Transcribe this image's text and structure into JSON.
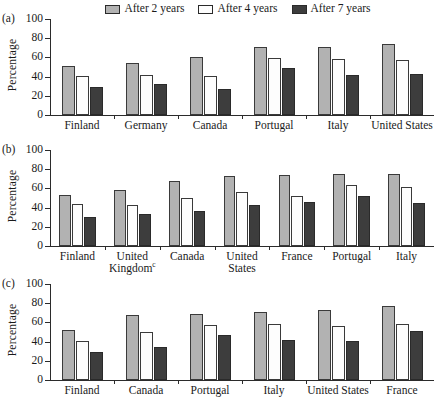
{
  "legend": {
    "entries": [
      {
        "label": "After 2 years",
        "color": "#b2b2b2",
        "name": "after-2-years"
      },
      {
        "label": "After 4 years",
        "color": "#fdfdfd",
        "name": "after-4-years"
      },
      {
        "label": "After 7 years",
        "color": "#3d3d3d",
        "name": "after-7-years"
      }
    ]
  },
  "axis": {
    "ylabel": "Percentage",
    "yticks": [
      0,
      20,
      40,
      60,
      80,
      100
    ],
    "ylim": [
      0,
      100
    ]
  },
  "panels": [
    {
      "tag": "(a)"
    },
    {
      "tag": "(b)"
    },
    {
      "tag": "(c)"
    }
  ],
  "chart_data": [
    {
      "type": "bar",
      "panel": "(a)",
      "title": "",
      "xlabel": "",
      "ylabel": "Percentage",
      "ylim": [
        0,
        100
      ],
      "yticks": [
        0,
        20,
        40,
        60,
        80,
        100
      ],
      "grid": false,
      "legend_position": "top-center",
      "categories": [
        "Finland",
        "Germany",
        "Canada",
        "Portugal",
        "Italy",
        "United States"
      ],
      "series": [
        {
          "name": "After 2 years",
          "color": "#b2b2b2",
          "values": [
            51,
            54,
            60,
            71,
            71,
            74
          ]
        },
        {
          "name": "After 4 years",
          "color": "#fdfdfd",
          "values": [
            41,
            42,
            41,
            59,
            58,
            57
          ]
        },
        {
          "name": "After 7 years",
          "color": "#3d3d3d",
          "values": [
            29,
            32,
            27,
            49,
            42,
            43
          ]
        }
      ]
    },
    {
      "type": "bar",
      "panel": "(b)",
      "title": "",
      "xlabel": "",
      "ylabel": "Percentage",
      "ylim": [
        0,
        100
      ],
      "yticks": [
        0,
        20,
        40,
        60,
        80,
        100
      ],
      "grid": false,
      "legend_position": "top-center",
      "categories": [
        "Finland",
        "United Kingdomᶜ",
        "Canada",
        "United States",
        "France",
        "Portugal",
        "Italy"
      ],
      "series": [
        {
          "name": "After 2 years",
          "color": "#b2b2b2",
          "values": [
            53,
            58,
            68,
            73,
            74,
            75,
            75
          ]
        },
        {
          "name": "After 4 years",
          "color": "#fdfdfd",
          "values": [
            44,
            43,
            50,
            56,
            52,
            64,
            61
          ]
        },
        {
          "name": "After 7 years",
          "color": "#3d3d3d",
          "values": [
            30,
            33,
            36,
            43,
            46,
            52,
            45
          ]
        }
      ]
    },
    {
      "type": "bar",
      "panel": "(c)",
      "title": "",
      "xlabel": "",
      "ylabel": "Percentage",
      "ylim": [
        0,
        100
      ],
      "yticks": [
        0,
        20,
        40,
        60,
        80,
        100
      ],
      "grid": false,
      "legend_position": "top-center",
      "categories": [
        "Finland",
        "Canada",
        "Portugal",
        "Italy",
        "United States",
        "France"
      ],
      "series": [
        {
          "name": "After 2 years",
          "color": "#b2b2b2",
          "values": [
            52,
            68,
            69,
            71,
            73,
            77
          ]
        },
        {
          "name": "After 4 years",
          "color": "#fdfdfd",
          "values": [
            41,
            50,
            57,
            58,
            56,
            58
          ]
        },
        {
          "name": "After 7 years",
          "color": "#3d3d3d",
          "values": [
            29,
            34,
            47,
            42,
            41,
            51
          ]
        }
      ]
    }
  ],
  "xlabels": {
    "a": [
      "Finland",
      "Germany",
      "Canada",
      "Portugal",
      "Italy",
      "United States"
    ],
    "b": [
      {
        "l1": "Finland",
        "l2": ""
      },
      {
        "l1": "United",
        "l2": "Kingdom",
        "sup": "c"
      },
      {
        "l1": "Canada",
        "l2": ""
      },
      {
        "l1": "United",
        "l2": "States"
      },
      {
        "l1": "France",
        "l2": ""
      },
      {
        "l1": "Portugal",
        "l2": ""
      },
      {
        "l1": "Italy",
        "l2": ""
      }
    ],
    "c": [
      "Finland",
      "Canada",
      "Portugal",
      "Italy",
      "United States",
      "France"
    ]
  }
}
